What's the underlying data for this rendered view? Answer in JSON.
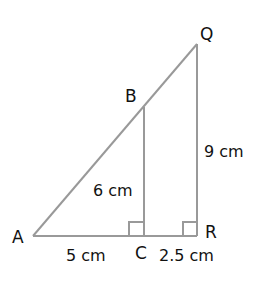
{
  "diagram": {
    "type": "similar-right-triangles",
    "line_color": "#999999",
    "text_color": "#111111",
    "points": {
      "A": "A",
      "B": "B",
      "C": "C",
      "Q": "Q",
      "R": "R"
    },
    "measurements": {
      "AC": "5 cm",
      "CR": "2.5 cm",
      "BC": "6 cm",
      "QR": "9 cm"
    },
    "right_angles": [
      "C",
      "R"
    ]
  }
}
